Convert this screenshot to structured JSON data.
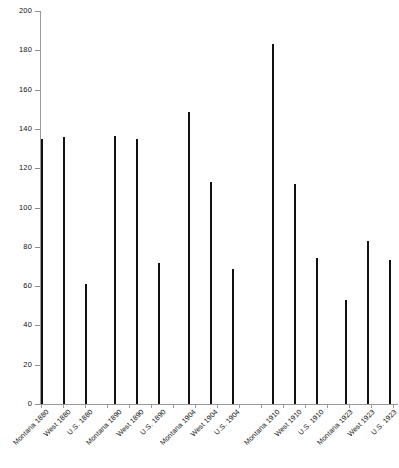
{
  "chart_data": {
    "type": "bar",
    "title": "",
    "subtitle": "",
    "xlabel": "",
    "ylabel": "",
    "ylim": [
      0,
      200
    ],
    "ytick_step": 20,
    "grid": false,
    "legend": null,
    "bar_color": "#111111",
    "axis_color": "#9a9a9a",
    "categories": [
      "Montana 1880",
      "West 1880",
      "U.S. 1880",
      "Montana 1890",
      "West 1890",
      "U.S. 1890",
      "Montana 1904",
      "West 1904",
      "U.S. 1904",
      "Montana 1910",
      "West 1910",
      "U.S. 1910",
      "Montana 1923",
      "West 1923",
      "U.S. 1923"
    ],
    "values": [
      135,
      136,
      61,
      136.5,
      135,
      72,
      148.5,
      113,
      68.5,
      183,
      112,
      74.5,
      53,
      83,
      73.5
    ],
    "yticks": [
      0,
      20,
      40,
      60,
      80,
      100,
      120,
      140,
      160,
      180,
      200
    ],
    "ytick_labels": [
      "0",
      "20",
      "40",
      "60",
      "80",
      "100",
      "120",
      "140",
      "160",
      "180",
      "200"
    ],
    "bar_x_positions": [
      41,
      63,
      85,
      114,
      136,
      158,
      188,
      210,
      232,
      272,
      294,
      316,
      345,
      367,
      389
    ],
    "group_gap_after": [
      2,
      5,
      8,
      11
    ]
  }
}
